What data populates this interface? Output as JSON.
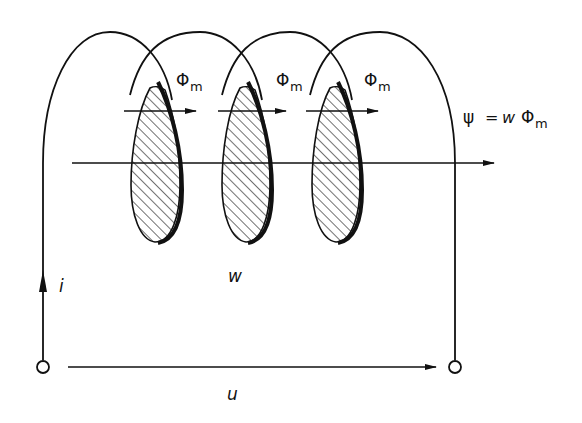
{
  "diagram": {
    "type": "coil-flux-linkage",
    "colors": {
      "ink": "#111111",
      "background": "#ffffff"
    },
    "coil": {
      "turns": 3,
      "turn_label": "w",
      "cross_sections": "hatched ellipses"
    },
    "labels": {
      "flux_per_turn": [
        "Φ",
        "Φ",
        "Φ"
      ],
      "flux_subscript": "m",
      "linkage_lhs": "ψ",
      "linkage_eq": "=",
      "linkage_w": "w",
      "linkage_phi": "Φ",
      "linkage_sub": "m",
      "current": "i",
      "voltage": "u",
      "turns": "w"
    },
    "arrows": {
      "flux_arrows": 3,
      "axis_arrow": "main flux axis to the right",
      "current_arrow": "upward on left lead",
      "voltage_arrow": "left-to-right between terminals"
    },
    "terminals": 2
  }
}
